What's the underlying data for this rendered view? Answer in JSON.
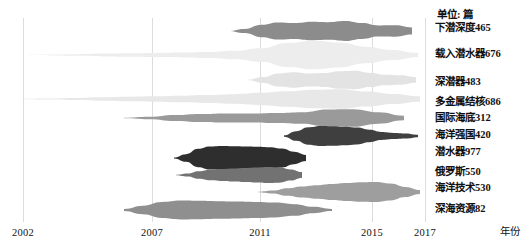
{
  "unit_label": "单位: 篇",
  "axis_name": "年份",
  "chart_data": {
    "type": "area",
    "title": "",
    "subtitle": "",
    "xlabel": "年份",
    "ylabel": "单位: 篇",
    "unit": "篇",
    "grid": true,
    "legend_position": "right",
    "xlim": [
      2002,
      2017
    ],
    "x_ticks": [
      "2002",
      "2007",
      "2011",
      "2015",
      "2017"
    ],
    "x_tick_values": [
      2002,
      2007,
      2011,
      2015,
      2017
    ],
    "x_tick_px": [
      23,
      152,
      260,
      372,
      425
    ],
    "series": [
      {
        "name": "下潜深度",
        "label": "下潜深度465",
        "total": 465,
        "color": "#8c8c8c",
        "band_top_px": 20,
        "band_height_px": 22,
        "start_px": 228,
        "end_px": 412,
        "profile": [
          0.02,
          0.3,
          0.62,
          0.78,
          0.72,
          0.84,
          0.8,
          0.9,
          0.72,
          0.55,
          0.8,
          0.92
        ],
        "values": [
          5,
          18,
          42,
          58,
          54,
          62,
          60,
          68,
          54,
          40,
          60,
          70
        ]
      },
      {
        "name": "载入潜水器",
        "label": "载入潜水器676",
        "total": 676,
        "color": "#ededed",
        "band_top_px": 40,
        "band_height_px": 30,
        "start_px": 26,
        "end_px": 418,
        "profile": [
          0.02,
          0.05,
          0.07,
          0.1,
          0.12,
          0.14,
          0.16,
          0.2,
          0.28,
          0.45,
          0.8,
          0.95,
          0.86,
          0.72,
          0.6,
          0.42
        ],
        "values": [
          3,
          8,
          11,
          15,
          18,
          21,
          24,
          30,
          42,
          66,
          118,
          140,
          126,
          106,
          88,
          60
        ]
      },
      {
        "name": "深潜器",
        "label": "深潜器483",
        "total": 483,
        "color": "#e3e3e3",
        "band_top_px": 70,
        "band_height_px": 20,
        "start_px": 248,
        "end_px": 416,
        "profile": [
          0.1,
          0.45,
          0.72,
          0.78,
          0.66,
          0.7,
          0.88,
          0.92,
          0.7,
          0.58,
          0.74,
          0.82
        ],
        "values": [
          6,
          28,
          44,
          48,
          40,
          43,
          54,
          56,
          43,
          35,
          45,
          50
        ]
      },
      {
        "name": "多金属结核",
        "label": "多金属结核686",
        "total": 686,
        "color": "#e8e8e8",
        "band_top_px": 88,
        "band_height_px": 22,
        "start_px": 22,
        "end_px": 420,
        "profile": [
          0.04,
          0.08,
          0.12,
          0.16,
          0.2,
          0.24,
          0.3,
          0.36,
          0.44,
          0.56,
          0.7,
          0.84,
          0.92,
          0.88,
          0.8,
          0.7
        ],
        "values": [
          6,
          12,
          18,
          24,
          30,
          36,
          44,
          53,
          64,
          82,
          102,
          122,
          134,
          128,
          116,
          102
        ]
      },
      {
        "name": "国际海底",
        "label": "国际海底312",
        "total": 312,
        "color": "#9a9a9a",
        "band_top_px": 108,
        "band_height_px": 20,
        "start_px": 124,
        "end_px": 404,
        "profile": [
          0.05,
          0.18,
          0.32,
          0.4,
          0.46,
          0.44,
          0.5,
          0.58,
          0.86,
          0.96,
          0.88,
          0.62
        ],
        "values": [
          2,
          7,
          12,
          15,
          17,
          16,
          19,
          22,
          32,
          36,
          33,
          23
        ]
      },
      {
        "name": "海洋强国",
        "label": "海洋强国420",
        "total": 420,
        "color": "#3f3f3f",
        "band_top_px": 126,
        "band_height_px": 20,
        "start_px": 284,
        "end_px": 418,
        "profile": [
          0.2,
          0.74,
          0.95,
          1.0,
          0.98,
          0.92,
          0.84,
          0.62,
          0.4,
          0.34,
          0.4,
          0.36
        ],
        "values": [
          10,
          36,
          47,
          50,
          49,
          46,
          42,
          31,
          20,
          17,
          20,
          18
        ]
      },
      {
        "name": "潜水器",
        "label": "潜水器977",
        "total": 977,
        "color": "#2e2e2e",
        "band_top_px": 146,
        "band_height_px": 24,
        "start_px": 174,
        "end_px": 306,
        "profile": [
          0.12,
          0.5,
          0.84,
          0.96,
          1.0,
          0.98,
          0.96,
          0.94,
          0.9,
          0.86,
          0.8,
          0.74
        ],
        "values": [
          18,
          72,
          120,
          138,
          144,
          140,
          138,
          134,
          128,
          122,
          114,
          106
        ]
      },
      {
        "name": "俄罗斯",
        "label": "俄罗斯550",
        "total": 550,
        "color": "#727272",
        "band_top_px": 166,
        "band_height_px": 18,
        "start_px": 176,
        "end_px": 302,
        "profile": [
          0.06,
          0.26,
          0.46,
          0.58,
          0.66,
          0.72,
          0.78,
          0.84,
          0.9,
          0.94,
          0.96,
          0.92
        ],
        "values": [
          5,
          18,
          31,
          39,
          44,
          48,
          52,
          56,
          60,
          63,
          64,
          61
        ]
      },
      {
        "name": "海洋技术",
        "label": "海洋技术530",
        "total": 530,
        "color": "#9e9e9e",
        "band_top_px": 182,
        "band_height_px": 20,
        "start_px": 258,
        "end_px": 420,
        "profile": [
          0.04,
          0.22,
          0.42,
          0.56,
          0.68,
          0.8,
          0.9,
          0.98,
          1.0,
          0.92,
          0.78,
          0.56
        ],
        "values": [
          3,
          14,
          26,
          35,
          42,
          50,
          56,
          61,
          62,
          57,
          48,
          35
        ]
      },
      {
        "name": "深海资源",
        "label": "深海资源82",
        "total": 82,
        "color": "#8f8f8f",
        "band_top_px": 200,
        "band_height_px": 20,
        "start_px": 124,
        "end_px": 332,
        "profile": [
          0.32,
          0.68,
          0.88,
          0.94,
          0.92,
          0.88,
          0.84,
          0.8,
          0.74,
          0.64,
          0.5,
          0.3
        ],
        "values": [
          3,
          6,
          8,
          8,
          8,
          8,
          7,
          7,
          7,
          6,
          5,
          3
        ]
      }
    ],
    "legend_entries_px": [
      {
        "label_index": 0,
        "top": 22
      },
      {
        "label_index": 1,
        "top": 48
      },
      {
        "label_index": 2,
        "top": 76
      },
      {
        "label_index": 3,
        "top": 96
      },
      {
        "label_index": 4,
        "top": 112
      },
      {
        "label_index": 5,
        "top": 129
      },
      {
        "label_index": 6,
        "top": 146
      },
      {
        "label_index": 7,
        "top": 166
      },
      {
        "label_index": 8,
        "top": 182
      },
      {
        "label_index": 9,
        "top": 203
      }
    ]
  }
}
